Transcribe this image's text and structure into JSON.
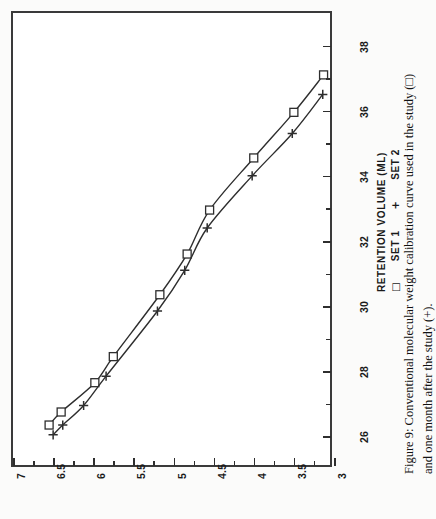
{
  "figure": {
    "caption_line1": "Figure 9:  Conventional molecular weight calibration curve used in the study (□)",
    "caption_line2": "and one month after the study (+).",
    "orientation": "rotated-90-ccw"
  },
  "legend": {
    "title": "RETENTION VOLUME (ML)",
    "entries": [
      {
        "symbol": "□",
        "label": "SET 1"
      },
      {
        "symbol": "+",
        "label": "SET 2"
      }
    ]
  },
  "axes": {
    "x_label": "RETENTION VOLUME (ML)",
    "x_ticks": [
      "26",
      "28",
      "30",
      "32",
      "34",
      "36",
      "38"
    ],
    "y_ticks": [
      "7",
      "6.5",
      "6",
      "5.5",
      "5",
      "4.5",
      "4",
      "3.5",
      "3"
    ]
  },
  "colors": {
    "ink": "#2e2e2e",
    "frame": "#3a3a3a",
    "paper": "#ffffff",
    "page": "#fbfbfa"
  },
  "chart_data": {
    "type": "line",
    "title": "Conventional molecular weight calibration curve",
    "xlabel": "RETENTION VOLUME (ML)",
    "ylabel": "LOG MOLECULAR WEIGHT",
    "xlim": [
      25,
      39
    ],
    "ylim": [
      3,
      7
    ],
    "xticks": [
      26,
      28,
      30,
      32,
      34,
      36,
      38
    ],
    "yticks": [
      7,
      6.5,
      6,
      5.5,
      5,
      4.5,
      4,
      3.5,
      3
    ],
    "grid": false,
    "legend_position": "bottom-right",
    "series": [
      {
        "name": "SET 1",
        "marker": "square",
        "x": [
          26.35,
          26.75,
          27.65,
          28.45,
          30.35,
          31.6,
          32.95,
          34.55,
          35.95,
          37.1
        ],
        "y": [
          6.55,
          6.4,
          5.98,
          5.75,
          5.17,
          4.83,
          4.55,
          4.0,
          3.5,
          3.13
        ]
      },
      {
        "name": "SET 2",
        "marker": "plus",
        "x": [
          26.05,
          26.35,
          26.95,
          27.85,
          29.85,
          31.1,
          32.4,
          34.0,
          35.3,
          36.5
        ],
        "y": [
          6.5,
          6.38,
          6.12,
          5.84,
          5.2,
          4.86,
          4.58,
          4.02,
          3.52,
          3.14
        ]
      }
    ]
  }
}
